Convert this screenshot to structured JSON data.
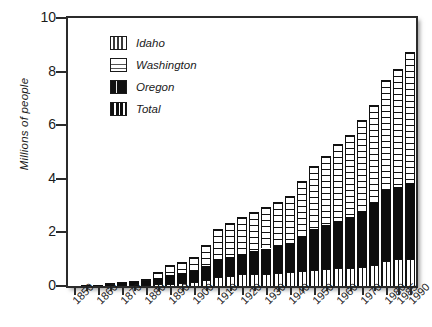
{
  "chart_data": {
    "type": "bar",
    "stacked": true,
    "title": "",
    "xlabel": "",
    "ylabel": "Millions of people",
    "ylim": [
      0,
      10
    ],
    "yticks": [
      0,
      2,
      4,
      6,
      8,
      10
    ],
    "grid": false,
    "legend_position": "upper-left-inside",
    "axis_tick_labels": [
      "1850",
      "1860",
      "1870",
      "1880",
      "1890",
      "1900",
      "1910",
      "1920",
      "1930",
      "1940",
      "1950",
      "1960",
      "1970",
      "1980",
      "1985",
      "1990"
    ],
    "categories": [
      "1850",
      "1855",
      "1860",
      "1865",
      "1870",
      "1875",
      "1880",
      "1885",
      "1890",
      "1895",
      "1900",
      "1905",
      "1910",
      "1915",
      "1920",
      "1925",
      "1930",
      "1935",
      "1940",
      "1945",
      "1950",
      "1955",
      "1960",
      "1965",
      "1970",
      "1975",
      "1980",
      "1985",
      "1990"
    ],
    "series": [
      {
        "name": "Idaho",
        "pattern": "vertical-thin-stripes",
        "values": [
          0.0,
          0.0,
          0.0,
          0.01,
          0.02,
          0.02,
          0.03,
          0.06,
          0.09,
          0.12,
          0.16,
          0.23,
          0.33,
          0.37,
          0.43,
          0.45,
          0.45,
          0.48,
          0.52,
          0.55,
          0.59,
          0.63,
          0.67,
          0.69,
          0.71,
          0.8,
          0.94,
          0.99,
          1.01
        ]
      },
      {
        "name": "Oregon",
        "pattern": "solid-black",
        "values": [
          0.01,
          0.03,
          0.05,
          0.07,
          0.09,
          0.12,
          0.17,
          0.24,
          0.32,
          0.35,
          0.41,
          0.52,
          0.67,
          0.73,
          0.78,
          0.86,
          0.95,
          1.01,
          1.09,
          1.32,
          1.52,
          1.64,
          1.77,
          1.89,
          2.09,
          2.29,
          2.63,
          2.69,
          2.84
        ]
      },
      {
        "name": "Washington",
        "pattern": "horizontal-rules",
        "values": [
          0.0,
          0.01,
          0.01,
          0.02,
          0.02,
          0.04,
          0.08,
          0.21,
          0.36,
          0.42,
          0.52,
          0.79,
          1.14,
          1.24,
          1.36,
          1.46,
          1.56,
          1.64,
          1.74,
          2.05,
          2.38,
          2.58,
          2.85,
          3.05,
          3.41,
          3.66,
          4.13,
          4.41,
          4.87
        ]
      },
      {
        "name": "Total",
        "pattern": "heavy-vertical-bands",
        "values": [
          0.01,
          0.04,
          0.06,
          0.1,
          0.13,
          0.18,
          0.28,
          0.51,
          0.77,
          0.89,
          1.09,
          1.54,
          2.14,
          2.34,
          2.57,
          2.77,
          2.96,
          3.13,
          3.35,
          3.92,
          4.49,
          4.85,
          5.29,
          5.63,
          6.21,
          6.75,
          7.7,
          8.09,
          8.72
        ]
      }
    ]
  },
  "legend": {
    "items": [
      {
        "label": "Idaho",
        "swatch": "idaho-swatch-icon"
      },
      {
        "label": "Washington",
        "swatch": "washington-swatch-icon"
      },
      {
        "label": "Oregon",
        "swatch": "oregon-swatch-icon"
      },
      {
        "label": "Total",
        "swatch": "total-swatch-icon"
      }
    ]
  },
  "axes": {
    "y_title": "Millions of people",
    "y_ticks": [
      "0",
      "2",
      "4",
      "6",
      "8",
      "10"
    ],
    "x_ticks": [
      "1850",
      "1860",
      "1870",
      "1880",
      "1890",
      "1900",
      "1910",
      "1920",
      "1930",
      "1940",
      "1950",
      "1960",
      "1970",
      "1980",
      "1985",
      "1990"
    ]
  }
}
